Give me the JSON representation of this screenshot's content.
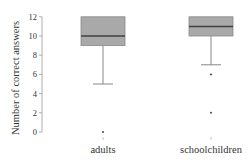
{
  "chart_data": {
    "type": "boxplot",
    "title": "",
    "xlabel": "",
    "ylabel": "Number of correct answers",
    "ylim": [
      0,
      12
    ],
    "yticks": [
      0,
      2,
      4,
      6,
      8,
      10,
      12
    ],
    "grid": false,
    "legend": null,
    "categories": [
      "adults",
      "schoolchildren"
    ],
    "series": [
      {
        "name": "adults",
        "whisker_low": 5,
        "q1": 9,
        "median": 10,
        "q3": 12,
        "whisker_high": 12,
        "outliers": [
          0
        ]
      },
      {
        "name": "schoolchildren",
        "whisker_low": 7,
        "q1": 10,
        "median": 11,
        "q3": 12,
        "whisker_high": 12,
        "outliers": [
          6,
          2
        ]
      }
    ],
    "colors": {
      "box_fill": "#a9a9a9",
      "box_stroke": "#888888",
      "median": "#404040",
      "whisker": "#888888",
      "axis": "#999999"
    }
  }
}
